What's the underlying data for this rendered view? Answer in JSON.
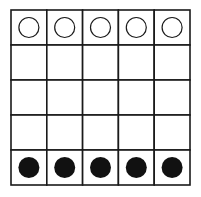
{
  "board": {
    "rows": 5,
    "cols": 5,
    "line_color": "#1a1a1a",
    "background": "#ffffff",
    "cells": [
      [
        "white",
        "white",
        "white",
        "white",
        "white"
      ],
      [
        "empty",
        "empty",
        "empty",
        "empty",
        "empty"
      ],
      [
        "empty",
        "empty",
        "empty",
        "empty",
        "empty"
      ],
      [
        "empty",
        "empty",
        "empty",
        "empty",
        "empty"
      ],
      [
        "black",
        "black",
        "black",
        "black",
        "black"
      ]
    ],
    "pieces": {
      "white": {
        "icon": "hollow-circle-icon",
        "fill": "#ffffff",
        "stroke": "#1a1a1a"
      },
      "black": {
        "icon": "filled-circle-icon",
        "fill": "#111111",
        "stroke": "#111111"
      }
    }
  }
}
